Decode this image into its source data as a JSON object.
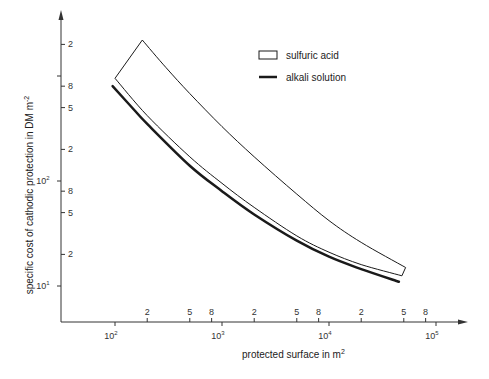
{
  "chart_data": {
    "type": "line",
    "title": "",
    "xlabel": "protected surface in m",
    "xlabel_sup": "2",
    "ylabel": "specific cost of cathodic protection in DM m",
    "ylabel_sup": "-2",
    "xscale": "log",
    "yscale": "log",
    "xlim": [
      30,
      150000
    ],
    "ylim": [
      5,
      3000
    ],
    "grid": false,
    "legend_position": "upper right",
    "x_ticks_major": [
      {
        "value": 100,
        "label": "10",
        "sup": "2"
      },
      {
        "value": 1000,
        "label": "10",
        "sup": "3"
      },
      {
        "value": 10000,
        "label": "10",
        "sup": "4"
      },
      {
        "value": 100000,
        "label": "10",
        "sup": "5"
      }
    ],
    "x_ticks_minor": [
      {
        "value": 200,
        "label": "2"
      },
      {
        "value": 500,
        "label": "5"
      },
      {
        "value": 800,
        "label": "8"
      },
      {
        "value": 2000,
        "label": "2"
      },
      {
        "value": 5000,
        "label": "5"
      },
      {
        "value": 8000,
        "label": "8"
      },
      {
        "value": 20000,
        "label": "2"
      },
      {
        "value": 50000,
        "label": "5"
      },
      {
        "value": 80000,
        "label": "8"
      }
    ],
    "y_ticks_major": [
      {
        "value": 10,
        "label": "10",
        "sup": "1"
      },
      {
        "value": 100,
        "label": "10",
        "sup": "2"
      },
      {
        "value": 1000,
        "label": "",
        "sup": ""
      }
    ],
    "y_ticks_minor": [
      {
        "value": 20,
        "label": "2"
      },
      {
        "value": 50,
        "label": "5"
      },
      {
        "value": 80,
        "label": "8"
      },
      {
        "value": 200,
        "label": "2"
      },
      {
        "value": 500,
        "label": "5"
      },
      {
        "value": 800,
        "label": "8"
      },
      {
        "value": 2000,
        "label": "2"
      }
    ],
    "series": [
      {
        "name": "sulfuric acid",
        "style": "band",
        "upper": {
          "x": [
            180,
            300,
            500,
            1000,
            2000,
            5000,
            10000,
            20000,
            52000
          ],
          "y": [
            2200,
            1200,
            680,
            330,
            170,
            75,
            42,
            26,
            15
          ]
        },
        "lower": {
          "x": [
            100,
            200,
            500,
            1000,
            2000,
            5000,
            10000,
            20000,
            48000
          ],
          "y": [
            950,
            420,
            170,
            95,
            56,
            30,
            21,
            16,
            12.5
          ]
        }
      },
      {
        "name": "alkali solution",
        "style": "thick-line",
        "x": [
          95,
          150,
          200,
          500,
          1000,
          2000,
          5000,
          10000,
          20000,
          45000
        ],
        "y": [
          800,
          480,
          350,
          140,
          80,
          48,
          27,
          19,
          14.5,
          11
        ]
      }
    ]
  },
  "legend": {
    "items": [
      {
        "label": "sulfuric acid",
        "swatch": "hollow-box"
      },
      {
        "label": "alkali solution",
        "swatch": "thick-line"
      }
    ]
  },
  "colors": {
    "line": "#1a1a1a",
    "axis": "#333333",
    "background": "#ffffff"
  }
}
